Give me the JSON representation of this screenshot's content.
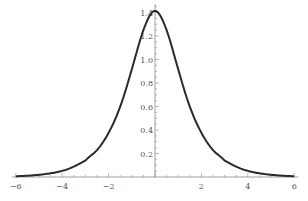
{
  "chart_data": {
    "type": "line",
    "title": "",
    "xlabel": "",
    "ylabel": "",
    "xlim": [
      -6,
      6
    ],
    "ylim": [
      0,
      1.45
    ],
    "grid": false,
    "legend": null,
    "x_ticks": [
      -6,
      -4,
      -2,
      2,
      4,
      6
    ],
    "x_tick_labels": [
      "−6",
      "−4",
      "−2",
      "2",
      "4",
      "6"
    ],
    "y_ticks": [
      0.2,
      0.4,
      0.6,
      0.8,
      1.0,
      1.2,
      1.4
    ],
    "y_tick_labels": [
      "0.2",
      "0.4",
      "0.6",
      "0.8",
      "1.0",
      "1.2",
      "1.4"
    ],
    "series": [
      {
        "name": "sqrt(2)*sech(x)",
        "color": "#2a2a2a",
        "x": [
          -6,
          -5,
          -4,
          -3,
          -2.5,
          -2,
          -1.5,
          -1,
          -0.5,
          0,
          0.5,
          1,
          1.5,
          2,
          2.5,
          3,
          4,
          5,
          6
        ],
        "y": [
          0.007,
          0.019,
          0.052,
          0.14,
          0.229,
          0.376,
          0.599,
          0.917,
          1.25,
          1.414,
          1.25,
          0.917,
          0.599,
          0.376,
          0.229,
          0.14,
          0.052,
          0.019,
          0.007
        ]
      }
    ]
  }
}
